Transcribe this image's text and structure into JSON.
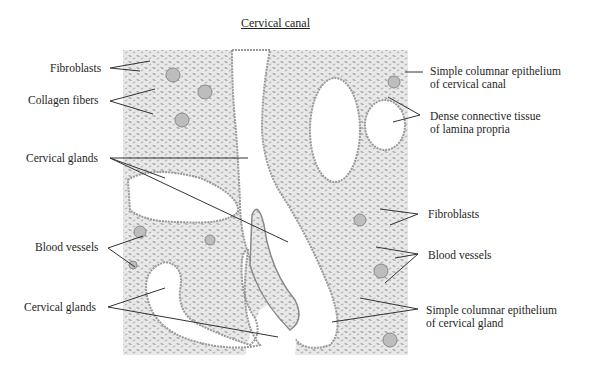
{
  "title": "Cervical canal",
  "labels": {
    "fibroblasts_left": "Fibroblasts",
    "collagen_fibers": "Collagen fibers",
    "cervical_glands_top": "Cervical glands",
    "blood_vessels_left": "Blood vessels",
    "cervical_glands_bottom": "Cervical glands",
    "epithelium_canal_line1": "Simple columnar epithelium",
    "epithelium_canal_line2": "of cervical canal",
    "dense_ct_line1": "Dense connective tissue",
    "dense_ct_line2": "of lamina propria",
    "fibroblasts_right": "Fibroblasts",
    "blood_vessels_right": "Blood vessels",
    "epithelium_gland_line1": "Simple columnar epithelium",
    "epithelium_gland_line2": "of cervical gland"
  },
  "colors": {
    "tissue": "#e4e4e4",
    "tissue_dark": "#9a9a9a",
    "lumen": "#ffffff",
    "leader": "#333333"
  }
}
